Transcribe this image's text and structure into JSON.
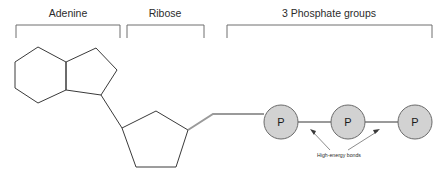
{
  "diagram": {
    "sections": [
      {
        "id": "adenine",
        "label": "Adenine",
        "bracket_x1": 16,
        "bracket_x2": 120,
        "label_x": 68
      },
      {
        "id": "ribose",
        "label": "Ribose",
        "bracket_x1": 127,
        "bracket_x2": 204,
        "label_x": 165
      },
      {
        "id": "phosphates",
        "label": "3 Phosphate groups",
        "bracket_x1": 227,
        "bracket_x2": 432,
        "label_x": 329
      }
    ],
    "bracket_top_y": 25,
    "bracket_tick_y": 38,
    "phosphates": [
      {
        "id": "phosphate-1",
        "letter": "P",
        "cx": 281,
        "cy": 122,
        "r": 17
      },
      {
        "id": "phosphate-2",
        "letter": "P",
        "cx": 348,
        "cy": 122,
        "r": 17
      },
      {
        "id": "phosphate-3",
        "letter": "P",
        "cx": 415,
        "cy": 122,
        "r": 17
      }
    ],
    "annotation": {
      "id": "high-energy-bonds",
      "text": "High-energy bonds",
      "x": 339,
      "y": 157
    },
    "colors": {
      "background": "#ffffff",
      "ring_stroke": "#3a3a3a",
      "bracket_stroke": "#6e6e6e",
      "chain_stroke": "#9a9a9a",
      "phosphate_fill": "#d2d2d2",
      "phosphate_stroke": "#6a6a6a",
      "text": "#2b2b2b"
    },
    "geometry": {
      "hexagon_points": "38,47 66,62 66,90 38,103 15,88 15,62",
      "pentagon_fused_points": "66,62 96,48 117,70 101,95 66,90",
      "adenine_to_ribose": "101,95 122,128",
      "ribose_pentagon_points": "122,128 156,111 188,130 176,167 136,167",
      "ribose_to_chain": "188,130 213,114",
      "chain_to_first_p": "213,114 264,114",
      "chain_p1_p2": "298,122 331,122",
      "chain_p2_p3": "365,122 398,122"
    }
  }
}
